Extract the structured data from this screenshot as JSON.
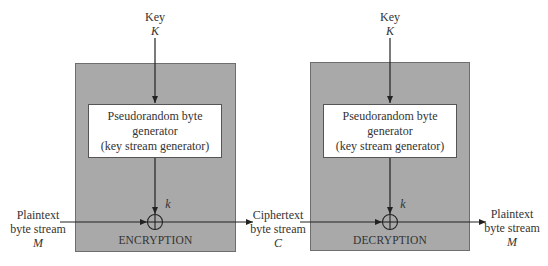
{
  "diagram": {
    "type": "stream-cipher-block-diagram",
    "encryption": {
      "key_label": "Key",
      "key_symbol": "K",
      "generator_lines": [
        "Pseudorandom byte",
        "generator",
        "(key stream generator)"
      ],
      "keystream_symbol": "k",
      "input_label_lines": [
        "Plaintext",
        "byte stream"
      ],
      "input_symbol": "M",
      "box_title": "ENCRYPTION",
      "operator": "xor"
    },
    "channel": {
      "label_lines": [
        "Ciphertext",
        "byte stream"
      ],
      "symbol": "C"
    },
    "decryption": {
      "key_label": "Key",
      "key_symbol": "K",
      "generator_lines": [
        "Pseudorandom byte",
        "generator",
        "(key stream generator)"
      ],
      "keystream_symbol": "k",
      "output_label_lines": [
        "Plaintext",
        "byte stream"
      ],
      "output_symbol": "M",
      "box_title": "DECRYPTION",
      "operator": "xor"
    },
    "colors": {
      "outer_box_fill": "#a9a9a9",
      "inner_box_fill": "#ffffff",
      "line": "#222222"
    }
  }
}
